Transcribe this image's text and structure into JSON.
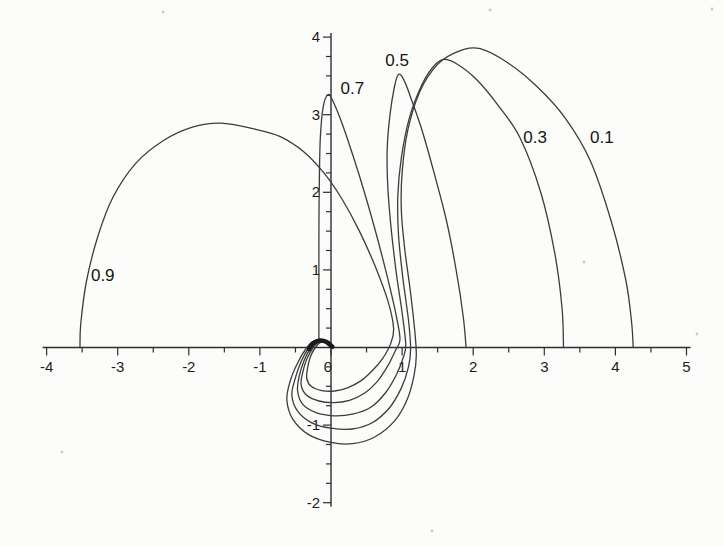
{
  "figure": {
    "background": "#fcfcfa",
    "ink": "#3c3c3c",
    "axis_ink": "#2e2e2e"
  },
  "chart_data": {
    "type": "line",
    "title": "",
    "subtitle": "",
    "xlabel": "",
    "ylabel": "",
    "grid": false,
    "legend_position": "inline-curve-labels",
    "xlim": [
      -4,
      5
    ],
    "ylim": [
      -2,
      4
    ],
    "x_major_ticks": [
      -4,
      -3,
      -2,
      -1,
      0,
      1,
      2,
      3,
      4,
      5
    ],
    "x_tick_labels": [
      "-4",
      "-3",
      "-2",
      "-1",
      "0",
      "1",
      "2",
      "3",
      "4",
      "5"
    ],
    "x_minor_step": 0.5,
    "y_major_ticks": [
      -2,
      -1,
      1,
      2,
      3,
      4
    ],
    "y_tick_labels": [
      "-2",
      "-1",
      "1",
      "2",
      "3",
      "4"
    ],
    "y_minor_step": 0.25,
    "series": [
      {
        "name": "curve-0.1",
        "label": "0.1",
        "label_pos": [
          3.81,
          2.71
        ],
        "points": [
          [
            0,
            0
          ],
          [
            -0.1,
            0.08
          ],
          [
            -0.22,
            0.09
          ],
          [
            -0.34,
            0
          ],
          [
            -0.47,
            -0.2
          ],
          [
            -0.58,
            -0.45
          ],
          [
            -0.62,
            -0.68
          ],
          [
            -0.54,
            -0.92
          ],
          [
            -0.32,
            -1.12
          ],
          [
            -0.02,
            -1.22
          ],
          [
            0.3,
            -1.24
          ],
          [
            0.62,
            -1.15
          ],
          [
            0.9,
            -0.94
          ],
          [
            1.08,
            -0.65
          ],
          [
            1.17,
            -0.35
          ],
          [
            1.2,
            -0.1
          ],
          [
            1.18,
            0.2
          ],
          [
            1.12,
            0.7
          ],
          [
            1.04,
            1.25
          ],
          [
            0.99,
            1.75
          ],
          [
            1.0,
            2.25
          ],
          [
            1.08,
            2.8
          ],
          [
            1.25,
            3.3
          ],
          [
            1.5,
            3.65
          ],
          [
            1.8,
            3.82
          ],
          [
            2.1,
            3.85
          ],
          [
            2.5,
            3.66
          ],
          [
            2.9,
            3.36
          ],
          [
            3.3,
            2.95
          ],
          [
            3.65,
            2.4
          ],
          [
            3.95,
            1.6
          ],
          [
            4.15,
            0.85
          ],
          [
            4.23,
            0.3
          ],
          [
            4.25,
            0
          ]
        ]
      },
      {
        "name": "curve-0.3",
        "label": "0.3",
        "label_pos": [
          2.87,
          2.71
        ],
        "points": [
          [
            0,
            0
          ],
          [
            -0.09,
            0.075
          ],
          [
            -0.2,
            0.085
          ],
          [
            -0.31,
            0
          ],
          [
            -0.42,
            -0.18
          ],
          [
            -0.51,
            -0.42
          ],
          [
            -0.55,
            -0.62
          ],
          [
            -0.47,
            -0.82
          ],
          [
            -0.27,
            -0.97
          ],
          [
            0,
            -1.04
          ],
          [
            0.3,
            -1.05
          ],
          [
            0.58,
            -0.97
          ],
          [
            0.82,
            -0.78
          ],
          [
            0.99,
            -0.52
          ],
          [
            1.09,
            -0.25
          ],
          [
            1.12,
            -0.02
          ],
          [
            1.09,
            0.35
          ],
          [
            1.01,
            0.9
          ],
          [
            0.95,
            1.45
          ],
          [
            0.94,
            1.95
          ],
          [
            0.99,
            2.45
          ],
          [
            1.1,
            2.95
          ],
          [
            1.26,
            3.35
          ],
          [
            1.42,
            3.6
          ],
          [
            1.57,
            3.71
          ],
          [
            1.76,
            3.66
          ],
          [
            2.05,
            3.45
          ],
          [
            2.35,
            3.12
          ],
          [
            2.66,
            2.7
          ],
          [
            2.95,
            2.0
          ],
          [
            3.15,
            1.2
          ],
          [
            3.25,
            0.5
          ],
          [
            3.27,
            0
          ]
        ]
      },
      {
        "name": "curve-0.5",
        "label": "0.5",
        "label_pos": [
          0.93,
          3.7
        ],
        "points": [
          [
            0,
            0
          ],
          [
            -0.08,
            0.07
          ],
          [
            -0.18,
            0.08
          ],
          [
            -0.28,
            0
          ],
          [
            -0.38,
            -0.17
          ],
          [
            -0.45,
            -0.38
          ],
          [
            -0.47,
            -0.56
          ],
          [
            -0.4,
            -0.73
          ],
          [
            -0.21,
            -0.84
          ],
          [
            0.04,
            -0.88
          ],
          [
            0.3,
            -0.86
          ],
          [
            0.56,
            -0.77
          ],
          [
            0.77,
            -0.58
          ],
          [
            0.92,
            -0.35
          ],
          [
            1.02,
            -0.12
          ],
          [
            1.05,
            0.05
          ],
          [
            1.0,
            0.45
          ],
          [
            0.92,
            0.95
          ],
          [
            0.85,
            1.5
          ],
          [
            0.8,
            2.05
          ],
          [
            0.79,
            2.55
          ],
          [
            0.83,
            3.0
          ],
          [
            0.89,
            3.35
          ],
          [
            0.95,
            3.52
          ],
          [
            1.03,
            3.44
          ],
          [
            1.13,
            3.2
          ],
          [
            1.28,
            2.8
          ],
          [
            1.45,
            2.25
          ],
          [
            1.62,
            1.65
          ],
          [
            1.76,
            1.0
          ],
          [
            1.86,
            0.4
          ],
          [
            1.9,
            0
          ]
        ]
      },
      {
        "name": "curve-0.7",
        "label": "0.7",
        "label_pos": [
          0.3,
          3.34
        ],
        "points": [
          [
            0,
            0
          ],
          [
            -0.07,
            0.065
          ],
          [
            -0.16,
            0.075
          ],
          [
            -0.25,
            0
          ],
          [
            -0.34,
            -0.15
          ],
          [
            -0.4,
            -0.33
          ],
          [
            -0.42,
            -0.48
          ],
          [
            -0.35,
            -0.61
          ],
          [
            -0.17,
            -0.69
          ],
          [
            0.04,
            -0.71
          ],
          [
            0.26,
            -0.68
          ],
          [
            0.47,
            -0.59
          ],
          [
            0.65,
            -0.44
          ],
          [
            0.79,
            -0.25
          ],
          [
            0.9,
            -0.05
          ],
          [
            0.97,
            0.1
          ],
          [
            0.92,
            0.4
          ],
          [
            0.8,
            0.88
          ],
          [
            0.64,
            1.45
          ],
          [
            0.47,
            2.0
          ],
          [
            0.3,
            2.5
          ],
          [
            0.15,
            2.9
          ],
          [
            0.03,
            3.17
          ],
          [
            -0.04,
            3.26
          ],
          [
            -0.11,
            3.1
          ],
          [
            -0.15,
            2.7
          ],
          [
            -0.165,
            2.1
          ],
          [
            -0.17,
            1.4
          ],
          [
            -0.17,
            0.7
          ],
          [
            -0.17,
            0.1
          ]
        ]
      },
      {
        "name": "curve-0.9",
        "label": "0.9",
        "label_pos": [
          -3.21,
          0.93
        ],
        "points": [
          [
            0,
            0
          ],
          [
            -0.06,
            0.06
          ],
          [
            -0.14,
            0.07
          ],
          [
            -0.22,
            0
          ],
          [
            -0.29,
            -0.12
          ],
          [
            -0.33,
            -0.27
          ],
          [
            -0.34,
            -0.4
          ],
          [
            -0.28,
            -0.5
          ],
          [
            -0.13,
            -0.555
          ],
          [
            0.05,
            -0.56
          ],
          [
            0.23,
            -0.52
          ],
          [
            0.42,
            -0.43
          ],
          [
            0.58,
            -0.3
          ],
          [
            0.72,
            -0.15
          ],
          [
            0.84,
            0.05
          ],
          [
            0.88,
            0.25
          ],
          [
            0.8,
            0.6
          ],
          [
            0.62,
            1.05
          ],
          [
            0.4,
            1.5
          ],
          [
            0.15,
            1.92
          ],
          [
            -0.1,
            2.25
          ],
          [
            -0.38,
            2.52
          ],
          [
            -0.72,
            2.72
          ],
          [
            -1.1,
            2.82
          ],
          [
            -1.55,
            2.89
          ],
          [
            -1.95,
            2.84
          ],
          [
            -2.35,
            2.67
          ],
          [
            -2.75,
            2.37
          ],
          [
            -3.07,
            1.93
          ],
          [
            -3.28,
            1.43
          ],
          [
            -3.44,
            0.85
          ],
          [
            -3.52,
            0.3
          ],
          [
            -3.53,
            0
          ]
        ]
      }
    ],
    "origin_hook": {
      "points": [
        [
          0.02,
          0.01
        ],
        [
          -0.06,
          0.07
        ],
        [
          -0.16,
          0.09
        ],
        [
          -0.26,
          0.05
        ],
        [
          -0.31,
          -0.02
        ]
      ]
    },
    "speckles": [
      [
        490,
        10
      ],
      [
        712,
        9
      ],
      [
        163,
        12
      ],
      [
        697,
        334
      ],
      [
        432,
        531
      ],
      [
        62,
        452
      ],
      [
        584,
        262
      ]
    ]
  }
}
